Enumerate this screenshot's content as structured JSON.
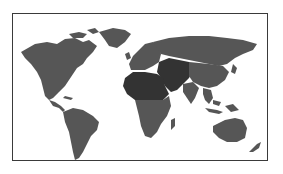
{
  "map": {
    "type": "world-map",
    "projection": "equirectangular-like",
    "colors": {
      "background": "#ffffff",
      "border": "#3a3a3a",
      "land": "#565656",
      "highlighted_land": "#333333"
    },
    "highlighted_regions": [
      "North Africa",
      "Middle East",
      "Central Asia",
      "Sub-Saharan Africa (north)"
    ],
    "regions": [
      "North America",
      "Greenland",
      "Central America",
      "South America",
      "Europe",
      "Africa",
      "Middle East",
      "Russia",
      "Asia",
      "Southeast Asia",
      "Australia",
      "New Zealand"
    ]
  }
}
